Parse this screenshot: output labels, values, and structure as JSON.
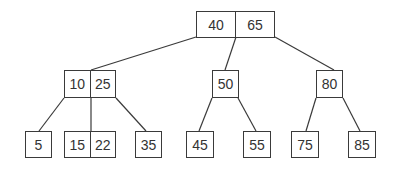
{
  "diagram": {
    "type": "b-tree",
    "colors": {
      "stroke": "#3a3a3a",
      "text": "#333333",
      "background": "#ffffff"
    },
    "nodes": {
      "root": {
        "keys": [
          "40",
          "65"
        ],
        "x": 196,
        "y": 11,
        "w": 79,
        "h": 27
      },
      "n10_25": {
        "keys": [
          "10",
          "25"
        ],
        "x": 64,
        "y": 70,
        "w": 52,
        "h": 28
      },
      "n50": {
        "keys": [
          "50"
        ],
        "x": 212,
        "y": 70,
        "w": 27,
        "h": 28
      },
      "n80": {
        "keys": [
          "80"
        ],
        "x": 316,
        "y": 70,
        "w": 27,
        "h": 28
      },
      "n5": {
        "keys": [
          "5"
        ],
        "x": 25,
        "y": 131,
        "w": 27,
        "h": 27
      },
      "n15_22": {
        "keys": [
          "15",
          "22"
        ],
        "x": 64,
        "y": 131,
        "w": 52,
        "h": 27
      },
      "n35": {
        "keys": [
          "35"
        ],
        "x": 135,
        "y": 131,
        "w": 27,
        "h": 27
      },
      "n45": {
        "keys": [
          "45"
        ],
        "x": 186,
        "y": 131,
        "w": 28,
        "h": 27
      },
      "n55": {
        "keys": [
          "55"
        ],
        "x": 243,
        "y": 131,
        "w": 28,
        "h": 27
      },
      "n75": {
        "keys": [
          "75"
        ],
        "x": 291,
        "y": 131,
        "w": 28,
        "h": 27
      },
      "n85": {
        "keys": [
          "85"
        ],
        "x": 348,
        "y": 131,
        "w": 28,
        "h": 27
      }
    },
    "edges": [
      {
        "from": "root",
        "to": "n10_25",
        "x1": 196,
        "y1": 37,
        "x2": 91,
        "y2": 70
      },
      {
        "from": "root",
        "to": "n50",
        "x1": 236,
        "y1": 37,
        "x2": 225,
        "y2": 70
      },
      {
        "from": "root",
        "to": "n80",
        "x1": 275,
        "y1": 37,
        "x2": 334,
        "y2": 70
      },
      {
        "from": "n10_25",
        "to": "n5",
        "x1": 64,
        "y1": 98,
        "x2": 39,
        "y2": 131
      },
      {
        "from": "n10_25",
        "to": "n15_22",
        "x1": 91,
        "y1": 98,
        "x2": 91,
        "y2": 131
      },
      {
        "from": "n10_25",
        "to": "n35",
        "x1": 116,
        "y1": 98,
        "x2": 146,
        "y2": 131
      },
      {
        "from": "n50",
        "to": "n45",
        "x1": 212,
        "y1": 98,
        "x2": 199,
        "y2": 131
      },
      {
        "from": "n50",
        "to": "n55",
        "x1": 238,
        "y1": 98,
        "x2": 256,
        "y2": 131
      },
      {
        "from": "n80",
        "to": "n75",
        "x1": 316,
        "y1": 98,
        "x2": 306,
        "y2": 131
      },
      {
        "from": "n80",
        "to": "n85",
        "x1": 343,
        "y1": 98,
        "x2": 360,
        "y2": 131
      }
    ]
  }
}
